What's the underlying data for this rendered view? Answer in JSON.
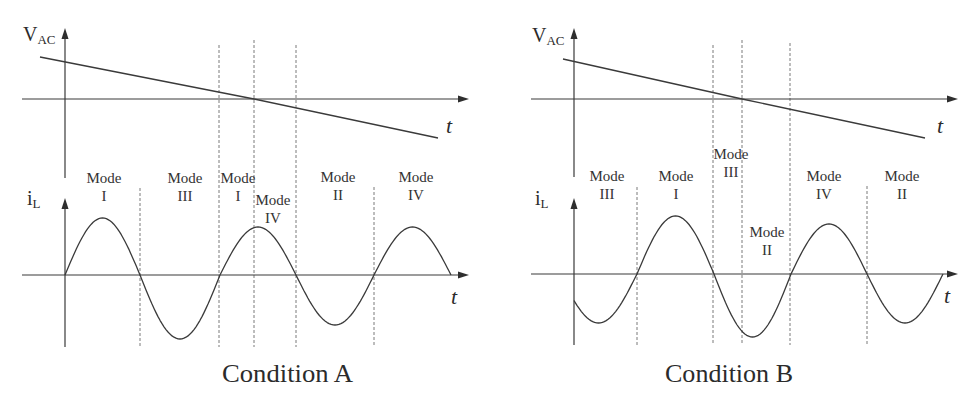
{
  "chart_data": [
    {
      "type": "line",
      "title": "Condition A",
      "xlabel": "t",
      "units": "arbitrary (schematic, no numeric ticks)",
      "vac": {
        "name": "V_AC",
        "label_main": "V",
        "label_sub": "AC",
        "points": [
          [
            -25,
            42
          ],
          [
            189,
            0
          ],
          [
            373,
            -39
          ]
        ]
      },
      "il": {
        "name": "i_L",
        "label_main": "i",
        "label_sub": "L",
        "start_t": 0,
        "half_cycles": [
          [
            0,
            75,
            57
          ],
          [
            75,
            155,
            -64
          ],
          [
            155,
            231,
            48
          ],
          [
            231,
            309,
            -50
          ],
          [
            309,
            386,
            48
          ]
        ]
      },
      "boundaries": [
        {
          "t": 75,
          "span": "il",
          "top": 87
        },
        {
          "t": 154,
          "span": "vac",
          "top": 54
        },
        {
          "t": 189,
          "span": "vac",
          "top": 59
        },
        {
          "t": 231,
          "span": "vac",
          "top": 54
        },
        {
          "t": 309,
          "span": "il",
          "top": 88
        }
      ],
      "boundary_bottom": -72,
      "modes": [
        {
          "mode": "Mode",
          "roman": "I",
          "t": 39,
          "v": 92
        },
        {
          "mode": "Mode",
          "roman": "III",
          "t": 120,
          "v": 92
        },
        {
          "mode": "Mode",
          "roman": "I",
          "t": 173,
          "v": 92
        },
        {
          "mode": "Mode",
          "roman": "IV",
          "t": 208,
          "v": 70
        },
        {
          "mode": "Mode",
          "roman": "II",
          "t": 273,
          "v": 93
        },
        {
          "mode": "Mode",
          "roman": "IV",
          "t": 351,
          "v": 93
        }
      ]
    },
    {
      "type": "line",
      "title": "Condition B",
      "xlabel": "t",
      "units": "arbitrary (schematic, no numeric ticks)",
      "vac": {
        "name": "V_AC",
        "label_main": "V",
        "label_sub": "AC",
        "points": [
          [
            -11,
            40
          ],
          [
            168,
            0
          ],
          [
            351,
            -39
          ]
        ]
      },
      "il": {
        "name": "i_L",
        "label_main": "i",
        "label_sub": "L",
        "start_t": 0,
        "half_cycles": [
          [
            -14,
            63,
            -49
          ],
          [
            63,
            140,
            58
          ],
          [
            140,
            217,
            -63
          ],
          [
            217,
            293,
            50
          ],
          [
            293,
            369,
            -49
          ]
        ]
      },
      "boundaries": [
        {
          "t": 63,
          "span": "il",
          "top": 87
        },
        {
          "t": 139,
          "span": "vac",
          "top": 54
        },
        {
          "t": 168,
          "span": "vac",
          "top": 59
        },
        {
          "t": 216,
          "span": "vac",
          "top": 56
        },
        {
          "t": 293,
          "span": "il",
          "top": 88
        }
      ],
      "boundary_bottom": -71,
      "modes": [
        {
          "mode": "Mode",
          "roman": "III",
          "t": 33,
          "v": 93
        },
        {
          "mode": "Mode",
          "roman": "I",
          "t": 102,
          "v": 93
        },
        {
          "mode": "Mode",
          "roman": "III",
          "t": 157,
          "v": 115
        },
        {
          "mode": "Mode",
          "roman": "II",
          "t": 193,
          "v": 37
        },
        {
          "mode": "Mode",
          "roman": "IV",
          "t": 250,
          "v": 93
        },
        {
          "mode": "Mode",
          "roman": "II",
          "t": 328,
          "v": 93
        }
      ]
    }
  ]
}
